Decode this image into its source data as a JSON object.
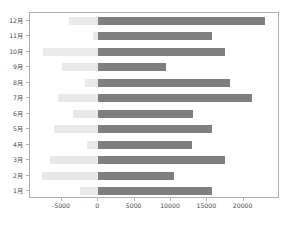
{
  "chart_data": {
    "type": "bar",
    "orientation": "horizontal",
    "title": "",
    "xlabel": "",
    "ylabel": "",
    "categories": [
      "1月",
      "2月",
      "3月",
      "4月",
      "5月",
      "6月",
      "7月",
      "8月",
      "9月",
      "10月",
      "11月",
      "12月"
    ],
    "series": [
      {
        "name": "negative",
        "color": "#e9e9e9",
        "values": [
          -2500,
          -7800,
          -6600,
          -1600,
          -6150,
          -3550,
          -5550,
          -1800,
          -4950,
          -7600,
          -750,
          -4000
        ]
      },
      {
        "name": "positive",
        "color": "#7f7f7f",
        "values": [
          15650,
          10450,
          17400,
          12900,
          15650,
          13050,
          21100,
          18100,
          9300,
          17500,
          15600,
          23000
        ]
      }
    ],
    "xlim": [
      -9400,
      25000
    ],
    "ylim": [
      0,
      12
    ],
    "xticks": [
      -5000,
      0,
      5000,
      10000,
      15000,
      20000
    ],
    "xticklabels": [
      "-5000",
      "0",
      "5000",
      "10000",
      "15000",
      "20000"
    ],
    "grid": false,
    "legend": "none",
    "frame_color": "#b0b0b0",
    "tick_color": "#4a4a4a"
  }
}
